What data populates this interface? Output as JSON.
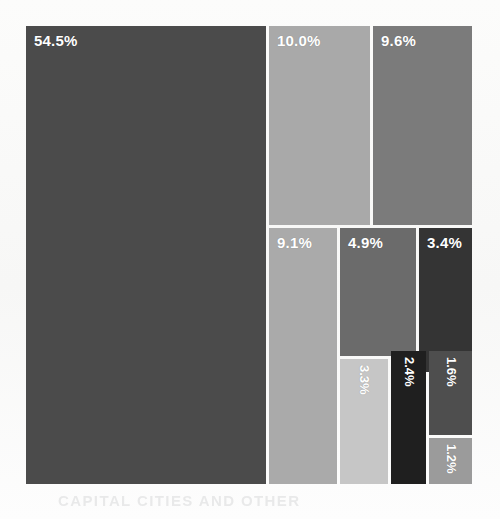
{
  "figure": {
    "background_color": "#fbfbfa",
    "plot_left": 26,
    "plot_top": 26,
    "plot_width": 446,
    "plot_height": 458,
    "ghost_text": "CAPITAL CITIES AND OTHER"
  },
  "chart_data": {
    "type": "treemap",
    "title": "",
    "subtitle": "",
    "xlabel": "",
    "ylabel": "",
    "grid": false,
    "legend": "none",
    "value_unit": "percent",
    "value_suffix": "%",
    "total": 100.0,
    "categories": [
      "54.5%",
      "10.0%",
      "9.6%",
      "9.1%",
      "4.9%",
      "3.4%",
      "3.3%",
      "2.4%",
      "1.6%",
      "1.2%"
    ],
    "values": [
      54.5,
      10.0,
      9.6,
      9.1,
      4.9,
      3.4,
      3.3,
      2.4,
      1.6,
      1.2
    ],
    "tiles": [
      {
        "label": "54.5%",
        "value": 54.5,
        "color": "#4b4b4b",
        "x": 0,
        "y": 0,
        "w": 240,
        "h": 458,
        "label_orientation": "horizontal",
        "label_size": "large"
      },
      {
        "label": "10.0%",
        "value": 10.0,
        "color": "#a9a9a9",
        "x": 243,
        "y": 0,
        "w": 101,
        "h": 199,
        "label_orientation": "horizontal",
        "label_size": "large"
      },
      {
        "label": "9.6%",
        "value": 9.6,
        "color": "#7b7b7b",
        "x": 347,
        "y": 0,
        "w": 99,
        "h": 199,
        "label_orientation": "horizontal",
        "label_size": "large"
      },
      {
        "label": "9.1%",
        "value": 9.1,
        "color": "#aaaaaa",
        "x": 243,
        "y": 202,
        "w": 68,
        "h": 256,
        "label_orientation": "horizontal",
        "label_size": "large"
      },
      {
        "label": "4.9%",
        "value": 4.9,
        "color": "#6b6b6b",
        "x": 314,
        "y": 202,
        "w": 76,
        "h": 128,
        "label_orientation": "horizontal",
        "label_size": "large"
      },
      {
        "label": "3.4%",
        "value": 3.4,
        "color": "#343434",
        "x": 393,
        "y": 202,
        "w": 53,
        "h": 144,
        "label_orientation": "horizontal",
        "label_size": "large"
      },
      {
        "label": "3.3%",
        "value": 3.3,
        "color": "#c6c6c6",
        "x": 314,
        "y": 333,
        "w": 48,
        "h": 125,
        "label_orientation": "vertical",
        "label_size": "small"
      },
      {
        "label": "2.4%",
        "value": 2.4,
        "color": "#1f1f1f",
        "x": 365,
        "y": 325,
        "w": 35,
        "h": 133,
        "label_orientation": "vertical",
        "label_size": "small"
      },
      {
        "label": "1.6%",
        "value": 1.6,
        "color": "#4e4e4e",
        "x": 403,
        "y": 325,
        "w": 43,
        "h": 84,
        "label_orientation": "vertical",
        "label_size": "small"
      },
      {
        "label": "1.2%",
        "value": 1.2,
        "color": "#9b9b9b",
        "x": 403,
        "y": 412,
        "w": 43,
        "h": 46,
        "label_orientation": "vertical",
        "label_size": "small"
      }
    ]
  }
}
